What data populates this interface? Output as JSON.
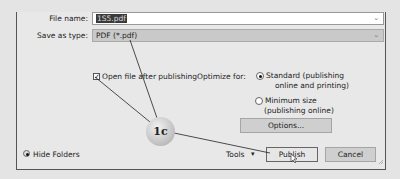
{
  "dialog": {
    "file_name_label": "File name:",
    "file_name_value": "1S5.pdf",
    "save_as_type_label": "Save as type:",
    "save_as_type_value": "PDF (*.pdf)",
    "open_after_publishing_label": "Open file after publishing",
    "open_after_publishing_checked": true,
    "optimize_for_label": "Optimize for:",
    "optimize_options": [
      {
        "line1": "Standard (publishing",
        "line2": "online and printing)",
        "selected": true
      },
      {
        "line1": "Minimum size",
        "line2": "(publishing online)",
        "selected": false
      }
    ],
    "options_button": "Options...",
    "hide_folders_label": "Hide Folders",
    "tools_label": "Tools",
    "publish_button": "Publish",
    "cancel_button": "Cancel"
  },
  "annotation": {
    "callout_label": "1c"
  },
  "icons": {
    "dropdown": "⌄",
    "tools_arrow": "▾",
    "check": "✓",
    "chevron_up": "⌃"
  }
}
